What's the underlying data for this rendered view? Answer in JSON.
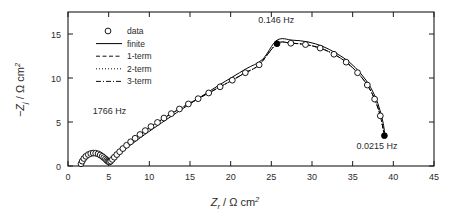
{
  "figure": {
    "background_color": "#ffffff",
    "line_color": "#000000"
  },
  "axes": {
    "x": {
      "title_symbol": "Z",
      "title_sub": "r",
      "title_unit": " / Ω cm",
      "title_sup": "2",
      "ticks": [
        "0",
        "5",
        "10",
        "15",
        "20",
        "25",
        "30",
        "35",
        "40",
        "45"
      ],
      "min": 0,
      "max": 45
    },
    "y": {
      "title_symbol": "−Z",
      "title_sub": "j",
      "title_unit": " / Ω cm",
      "title_sup": "2",
      "ticks": [
        "0",
        "5",
        "10",
        "15"
      ],
      "min": 0,
      "max": 17.5
    }
  },
  "legend": {
    "entries": [
      {
        "label": "data",
        "style": "open-circle-marker"
      },
      {
        "label": "finite",
        "style": "solid-line"
      },
      {
        "label": "1-term",
        "style": "dashed-line"
      },
      {
        "label": "2-term",
        "style": "dotted-line"
      },
      {
        "label": "3-term",
        "style": "dashdot-line"
      }
    ]
  },
  "annotations": [
    {
      "name": "high-frequency-label",
      "text": "1766 Hz",
      "x": 5.1,
      "y": 5.9
    },
    {
      "name": "peak-frequency-label",
      "text": "0.146 Hz",
      "x": 25.6,
      "y": 16.2
    },
    {
      "name": "low-frequency-label",
      "text": "0.0215 Hz",
      "x": 38.0,
      "y": 1.9
    }
  ],
  "chart_data": {
    "type": "scatter",
    "title": "",
    "xlabel": "Z_r / Ω cm^2",
    "ylabel": "-Z_j / Ω cm^2",
    "xlim": [
      0,
      45
    ],
    "ylim": [
      0,
      17.5
    ],
    "grid": false,
    "legend_position": "upper-left-inside",
    "marked_points": [
      {
        "label": "1766 Hz",
        "x": 1.6,
        "y": 0.25,
        "filled": false
      },
      {
        "label": "0.146 Hz",
        "x": 25.7,
        "y": 13.9,
        "filled": true
      },
      {
        "label": "0.0215 Hz",
        "x": 38.9,
        "y": 3.45,
        "filled": true
      }
    ],
    "series": [
      {
        "name": "data",
        "style": "open-circle-marker",
        "x": [
          1.6,
          1.75,
          1.95,
          2.2,
          2.5,
          2.8,
          3.1,
          3.4,
          3.7,
          3.95,
          4.2,
          4.4,
          4.6,
          4.75,
          4.88,
          5.0,
          5.1,
          5.25,
          5.45,
          5.7,
          6.0,
          6.35,
          6.75,
          7.2,
          7.7,
          8.25,
          8.85,
          9.5,
          10.2,
          11.0,
          11.8,
          12.7,
          13.7,
          14.8,
          16.0,
          17.3,
          18.7,
          20.2,
          21.8,
          23.5,
          25.7,
          27.4,
          29.2,
          31.0,
          32.7,
          34.2,
          35.6,
          36.8,
          37.7,
          38.4,
          38.9
        ],
        "y": [
          0.25,
          0.55,
          0.85,
          1.1,
          1.3,
          1.42,
          1.47,
          1.45,
          1.38,
          1.25,
          1.1,
          0.95,
          0.8,
          0.66,
          0.55,
          0.48,
          0.46,
          0.55,
          0.75,
          1.0,
          1.3,
          1.62,
          1.98,
          2.35,
          2.75,
          3.15,
          3.58,
          4.02,
          4.48,
          4.95,
          5.45,
          5.95,
          6.48,
          7.05,
          7.65,
          8.3,
          9.0,
          9.75,
          10.6,
          11.5,
          13.9,
          13.95,
          13.8,
          13.4,
          12.7,
          11.8,
          10.6,
          9.2,
          7.6,
          5.7,
          3.45
        ]
      },
      {
        "name": "finite",
        "style": "solid-line",
        "x": [
          1.6,
          1.8,
          2.1,
          2.45,
          2.8,
          3.2,
          3.6,
          4.0,
          4.35,
          4.65,
          4.9,
          5.05,
          5.2,
          5.5,
          5.9,
          6.4,
          7.0,
          7.7,
          8.5,
          9.4,
          10.4,
          11.5,
          12.7,
          14.0,
          15.4,
          16.9,
          18.5,
          20.2,
          22.0,
          23.9,
          25.7,
          27.6,
          29.5,
          31.3,
          33.0,
          34.6,
          36.0,
          37.2,
          38.1,
          38.7,
          39.0
        ],
        "y": [
          0.25,
          0.6,
          0.95,
          1.25,
          1.42,
          1.5,
          1.48,
          1.38,
          1.2,
          1.0,
          0.75,
          0.55,
          0.5,
          0.72,
          1.05,
          1.45,
          1.9,
          2.4,
          2.95,
          3.55,
          4.2,
          4.9,
          5.65,
          6.45,
          7.3,
          8.2,
          9.15,
          10.1,
          11.1,
          12.1,
          14.3,
          14.3,
          14.1,
          13.6,
          12.8,
          11.8,
          10.5,
          8.95,
          7.1,
          5.1,
          3.3
        ]
      }
    ]
  }
}
